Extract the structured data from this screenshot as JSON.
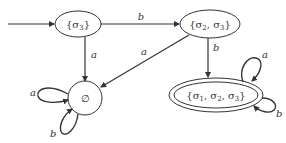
{
  "diagram": {
    "type": "DFA state transition diagram",
    "states": [
      {
        "id": "s3",
        "label": "{σ3}",
        "start": true,
        "accepting": false
      },
      {
        "id": "s23",
        "label": "{σ2, σ3}",
        "start": false,
        "accepting": false
      },
      {
        "id": "empty",
        "label": "∅",
        "start": false,
        "accepting": false
      },
      {
        "id": "s123",
        "label": "{σ1, σ2, σ3}",
        "start": false,
        "accepting": true
      }
    ],
    "transitions": [
      {
        "from": "s3",
        "to": "s23",
        "label": "b"
      },
      {
        "from": "s3",
        "to": "empty",
        "label": "a"
      },
      {
        "from": "s23",
        "to": "empty",
        "label": "a"
      },
      {
        "from": "s23",
        "to": "s123",
        "label": "b"
      },
      {
        "from": "empty",
        "to": "empty",
        "label": "a"
      },
      {
        "from": "empty",
        "to": "empty",
        "label": "b"
      },
      {
        "from": "s123",
        "to": "s123",
        "label": "a"
      },
      {
        "from": "s123",
        "to": "s123",
        "label": "b"
      }
    ],
    "labels": {
      "s3_prefix": "{σ",
      "s3_sub": "3",
      "s3_suffix": "}",
      "s23_a": "{σ",
      "s23_a_sub": "2",
      "s23_b": ",  σ",
      "s23_b_sub": "3",
      "s23_c": "}",
      "empty": "∅",
      "s123_a": "{σ",
      "s123_a_sub": "1",
      "s123_b": ",  σ",
      "s123_b_sub": "2",
      "s123_c": ",  σ",
      "s123_c_sub": "3",
      "s123_d": "}",
      "edge_s3_s23": "b",
      "edge_s3_empty": "a",
      "edge_s23_empty": "a",
      "edge_s23_s123": "b",
      "loop_empty_a": "a",
      "loop_empty_b": "b",
      "loop_s123_a": "a",
      "loop_s123_b": "b"
    }
  }
}
